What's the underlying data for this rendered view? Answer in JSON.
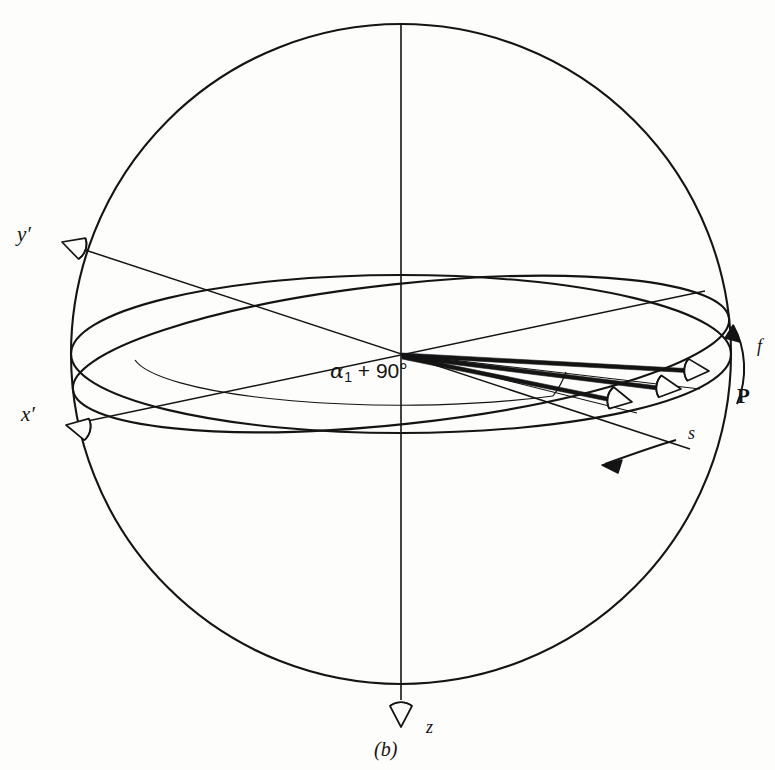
{
  "figure": {
    "caption": "(b)",
    "background_color": "#fdfdfb",
    "line_color": "#141414"
  },
  "labels": {
    "y_axis": "y′",
    "x_axis": "x′",
    "z_axis": "z",
    "point_p": "P",
    "rotation_f": "f",
    "slip_s": "s",
    "angle_symbol": "α",
    "angle_subscript": "1",
    "angle_operator": "+",
    "angle_value": "90°",
    "angle_full": "α₁ + 90°"
  },
  "icons": {
    "y_axis_arrow": "cone-arrowhead-icon",
    "x_axis_arrow": "cone-arrowhead-icon",
    "z_axis_arrow": "cone-arrowhead-icon",
    "slip_vector_arrows": "cone-arrowhead-icon",
    "rotation_arrow": "curved-arrow-icon",
    "slip_direction_arrow": "straight-arrow-icon"
  },
  "geometry": {
    "sphere_center_x": 401,
    "sphere_center_y": 354,
    "sphere_radius": 330,
    "point_p_x": 722,
    "point_p_y": 369,
    "equator_ellipse_ry": 79,
    "lower_ellipse_ry": 70,
    "slip_vector_count": 3
  }
}
